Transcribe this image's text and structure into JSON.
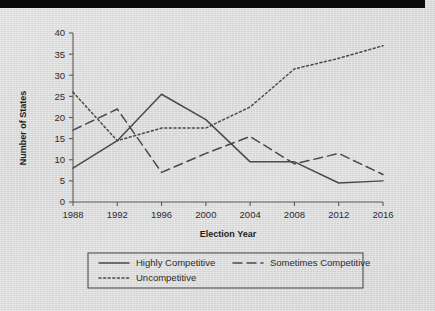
{
  "figure": {
    "background_color": "#d9d9d9",
    "ink_color": "#4a4a4a",
    "top_bar_color": "#0a0a0a"
  },
  "axes": {
    "x_title": "Election Year",
    "y_title": "Number of States",
    "x_ticks": [
      "1988",
      "1992",
      "1996",
      "2000",
      "2004",
      "2008",
      "2012",
      "2016"
    ],
    "y_ticks": [
      "0",
      "5",
      "10",
      "15",
      "20",
      "25",
      "30",
      "35",
      "40"
    ]
  },
  "legend": {
    "items": [
      {
        "label": "Highly Competitive",
        "style": "solid"
      },
      {
        "label": "Sometimes Competitive",
        "style": "dashed"
      },
      {
        "label": "Uncompetitive",
        "style": "dotted"
      }
    ]
  },
  "chart_data": {
    "type": "line",
    "title": "",
    "xlabel": "Election Year",
    "ylabel": "Number of States",
    "x": [
      1988,
      1992,
      1996,
      2000,
      2004,
      2008,
      2012,
      2016
    ],
    "categories": [
      "1988",
      "1992",
      "1996",
      "2000",
      "2004",
      "2008",
      "2012",
      "2016"
    ],
    "xlim": [
      1988,
      2016
    ],
    "ylim": [
      0,
      40
    ],
    "yticks": [
      0,
      5,
      10,
      15,
      20,
      25,
      30,
      35,
      40
    ],
    "grid": false,
    "legend_position": "below-axes",
    "series": [
      {
        "name": "Highly Competitive",
        "style": "solid",
        "values": [
          8,
          14.5,
          25.5,
          19.5,
          9.5,
          9.5,
          4.5,
          5
        ]
      },
      {
        "name": "Sometimes Competitive",
        "style": "dashed",
        "values": [
          17,
          22,
          7,
          11.5,
          15.5,
          9,
          11.5,
          6.5
        ]
      },
      {
        "name": "Uncompetitive",
        "style": "dotted",
        "values": [
          26,
          14.5,
          17.5,
          17.5,
          22.5,
          31.5,
          34,
          37
        ]
      }
    ]
  }
}
